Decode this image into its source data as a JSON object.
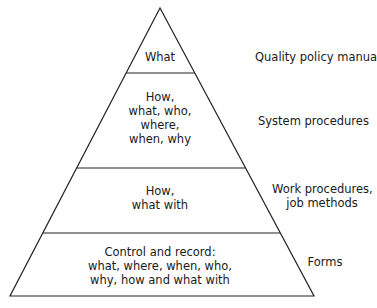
{
  "diagram": {
    "type": "pyramid",
    "levels": [
      {
        "inner_lines": [
          "What"
        ],
        "label_lines": [
          "Quality policy manual"
        ]
      },
      {
        "inner_lines": [
          "How,",
          "what, who,",
          "where,",
          "when, why"
        ],
        "label_lines": [
          "System procedures"
        ]
      },
      {
        "inner_lines": [
          "How,",
          "what with"
        ],
        "label_lines": [
          "Work procedures,",
          "job methods"
        ]
      },
      {
        "inner_lines": [
          "Control and record:",
          "what, where, when, who,",
          "why, how and what with"
        ],
        "label_lines": [
          "Forms"
        ]
      }
    ]
  }
}
